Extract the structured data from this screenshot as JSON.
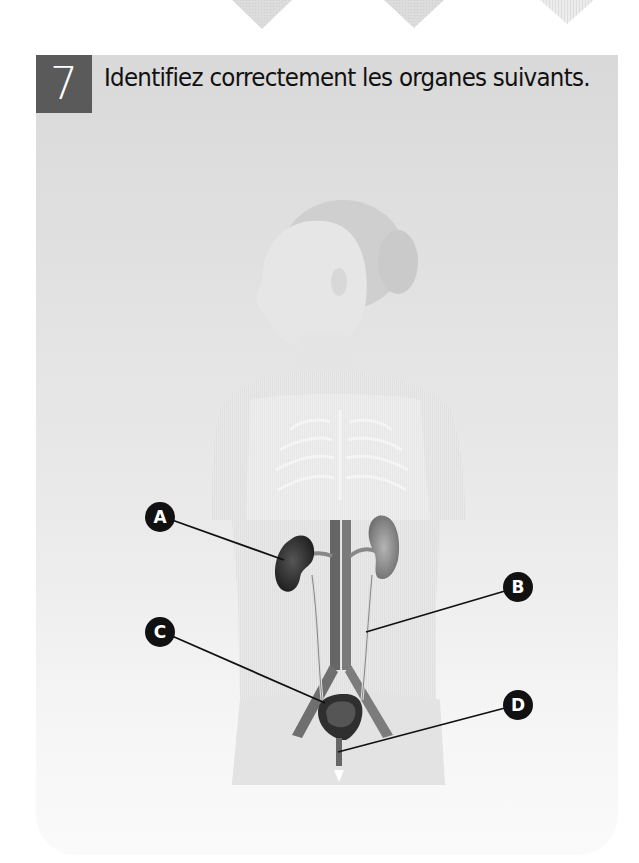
{
  "exercise": {
    "number": "7",
    "instruction": "Identifiez correctement les organes suivants."
  },
  "figure": {
    "labels": [
      {
        "id": "A",
        "letter": "A"
      },
      {
        "id": "B",
        "letter": "B"
      },
      {
        "id": "C",
        "letter": "C"
      },
      {
        "id": "D",
        "letter": "D"
      }
    ]
  },
  "colors": {
    "number_box": "#5a5a5a",
    "panel_top": "#d9d9d9",
    "marker": "#111111"
  }
}
